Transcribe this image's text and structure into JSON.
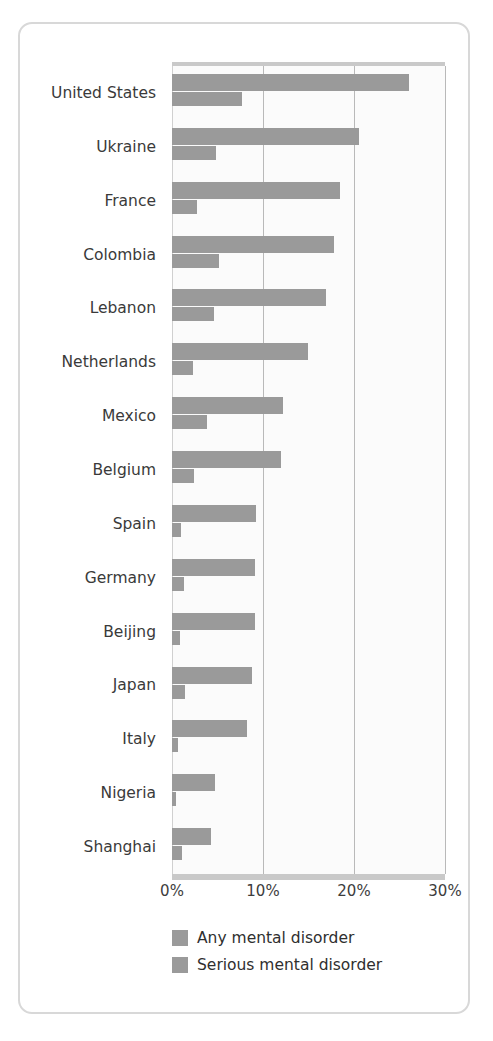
{
  "chart_data": {
    "type": "bar",
    "orientation": "horizontal",
    "title": "",
    "subtitle": "",
    "xlabel": "",
    "ylabel": "",
    "xlim": [
      0,
      30
    ],
    "xticks": [
      "0%",
      "10%",
      "20%",
      "30%"
    ],
    "xtick_values": [
      0,
      10,
      20,
      30
    ],
    "grid": "vertical",
    "legend_position": "bottom-left",
    "categories": [
      "United States",
      "Ukraine",
      "France",
      "Colombia",
      "Lebanon",
      "Netherlands",
      "Mexico",
      "Belgium",
      "Spain",
      "Germany",
      "Beijing",
      "Japan",
      "Italy",
      "Nigeria",
      "Shanghai"
    ],
    "series": [
      {
        "name": "Any mental disorder",
        "color": "#9a9a9a",
        "values": [
          26.0,
          20.5,
          18.5,
          17.8,
          16.9,
          14.9,
          12.2,
          12.0,
          9.2,
          9.1,
          9.1,
          8.8,
          8.2,
          4.7,
          4.3
        ]
      },
      {
        "name": "Serious mental disorder",
        "color": "#9a9a9a",
        "values": [
          7.7,
          4.8,
          2.7,
          5.2,
          4.6,
          2.3,
          3.9,
          2.4,
          1.0,
          1.3,
          0.9,
          1.4,
          0.7,
          0.4,
          1.1
        ]
      }
    ]
  },
  "legend": {
    "items": [
      {
        "label": "Any mental disorder"
      },
      {
        "label": "Serious mental disorder"
      }
    ]
  },
  "colors": {
    "bar": "#9a9a9a",
    "grid": "#b9b9b9",
    "plot_background": "#fbfbfb",
    "axis_rule": "#c9c9c9",
    "card_border": "#d8d8d8",
    "text": "#3a3a3a"
  }
}
